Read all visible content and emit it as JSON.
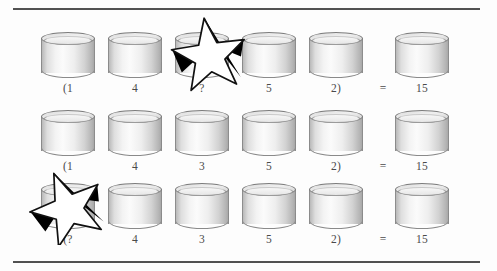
{
  "figure": {
    "background_color": "#fdfdfd",
    "rule_color": "#2f2f2f",
    "cylinder_fill": "#f1f1f1",
    "cylinder_stroke": "#8a8a8a",
    "star_fill": "#ffffff",
    "star_shadow": "#000000",
    "label_color": "#4a4a4a"
  },
  "rows": [
    {
      "id": "row-1",
      "cells": [
        {
          "label": "(1",
          "has_star": true
        },
        {
          "label": "4",
          "has_star": false
        },
        {
          "label": "?",
          "has_star": false
        },
        {
          "label": "5",
          "has_star": false
        },
        {
          "label": "2)",
          "has_star": false
        }
      ],
      "equals": "=",
      "result_label": "15",
      "star_on_cell": 2,
      "equation": "(1 4 ? 5 2) = 15"
    },
    {
      "id": "row-2",
      "cells": [
        {
          "label": "(1",
          "has_star": false
        },
        {
          "label": "4",
          "has_star": false
        },
        {
          "label": "3",
          "has_star": false
        },
        {
          "label": "5",
          "has_star": false
        },
        {
          "label": "2)",
          "has_star": false
        }
      ],
      "equals": "=",
      "result_label": "15",
      "star_on_cell": null,
      "equation": "(1 4 3 5 2) = 15"
    },
    {
      "id": "row-3",
      "cells": [
        {
          "label": "(?",
          "has_star": true
        },
        {
          "label": "4",
          "has_star": false
        },
        {
          "label": "3",
          "has_star": false
        },
        {
          "label": "5",
          "has_star": false
        },
        {
          "label": "2)",
          "has_star": false
        }
      ],
      "equals": "=",
      "result_label": "15",
      "star_on_cell": 0,
      "equation": "(? 4 3 5 2) = 15"
    }
  ]
}
